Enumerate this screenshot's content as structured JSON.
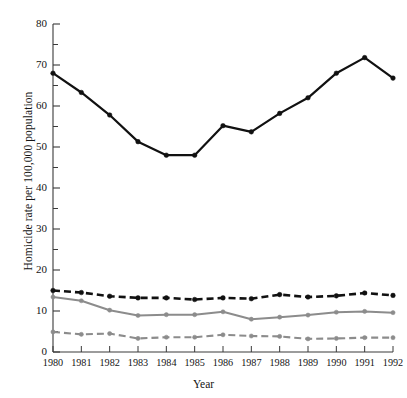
{
  "chart_data": {
    "type": "line",
    "title": "",
    "xlabel": "Year",
    "ylabel": "Homicide rate per 100,000 population",
    "categories": [
      "1980",
      "1981",
      "1982",
      "1983",
      "1984",
      "1985",
      "1986",
      "1987",
      "1988",
      "1989",
      "1990",
      "1991",
      "1992"
    ],
    "x": [
      1980,
      1981,
      1982,
      1983,
      1984,
      1985,
      1986,
      1987,
      1988,
      1989,
      1990,
      1991,
      1992
    ],
    "xlim": [
      1980,
      1992
    ],
    "ylim": [
      0,
      80
    ],
    "y_major_ticks": [
      0,
      10,
      20,
      30,
      40,
      50,
      60,
      70,
      80
    ],
    "y_minor_ticks": [
      5,
      15,
      25,
      35,
      45,
      55,
      65,
      75
    ],
    "y_tick_labels": [
      "0",
      "10",
      "20",
      "30",
      "40",
      "50",
      "60",
      "70",
      "80"
    ],
    "grid": false,
    "legend": "none",
    "series": [
      {
        "name": "series-1-black-solid",
        "color": "#111111",
        "style": "solid",
        "marker": "circle",
        "values": [
          68.0,
          63.3,
          57.8,
          51.3,
          48.0,
          48.0,
          55.2,
          53.7,
          58.2,
          62.0,
          68.0,
          71.8,
          66.8
        ]
      },
      {
        "name": "series-2-black-dashed",
        "color": "#111111",
        "style": "dashed",
        "marker": "circle",
        "values": [
          15.0,
          14.5,
          13.6,
          13.2,
          13.2,
          12.8,
          13.2,
          13.0,
          14.0,
          13.4,
          13.7,
          14.4,
          13.8
        ]
      },
      {
        "name": "series-3-gray-solid",
        "color": "#8c8c8c",
        "style": "solid",
        "marker": "circle",
        "values": [
          13.4,
          12.5,
          10.2,
          8.9,
          9.1,
          9.1,
          9.8,
          8.0,
          8.5,
          9.0,
          9.7,
          9.9,
          9.6
        ]
      },
      {
        "name": "series-4-gray-dashed",
        "color": "#8c8c8c",
        "style": "dashed",
        "marker": "circle",
        "values": [
          4.9,
          4.3,
          4.5,
          3.3,
          3.6,
          3.6,
          4.2,
          3.9,
          3.8,
          3.2,
          3.3,
          3.5,
          3.5
        ]
      }
    ]
  },
  "axes": {
    "y_labels": [
      "80",
      "70",
      "60",
      "50",
      "40",
      "30",
      "20",
      "10",
      "0"
    ],
    "x_labels": [
      "1980",
      "1981",
      "1982",
      "1983",
      "1984",
      "1985",
      "1986",
      "1987",
      "1988",
      "1989",
      "1990",
      "1991",
      "1992"
    ],
    "y_title": "Homicide rate per 100,000 population",
    "x_title": "Year"
  }
}
